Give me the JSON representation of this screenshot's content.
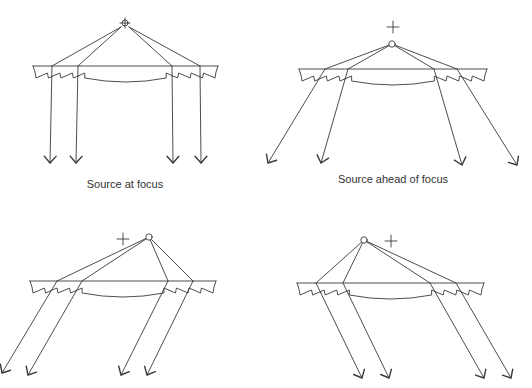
{
  "figure": {
    "colors": {
      "line": "#3a3a3a",
      "background": "#ffffff",
      "text": "#333333"
    }
  },
  "panels": [
    {
      "id": "at-focus",
      "caption": "Source at focus",
      "caption_pos": [
        125,
        178
      ],
      "lens": {
        "x0": 33,
        "x1": 218,
        "y": 66
      },
      "focus_marker": {
        "type": "crosshair-circle",
        "x": 125,
        "y": 23
      },
      "source": {
        "x": 125,
        "y": 23,
        "show_circle": false
      },
      "rays": [
        {
          "hit_x": 52,
          "tip": [
            50,
            163
          ]
        },
        {
          "hit_x": 78,
          "tip": [
            76,
            163
          ]
        },
        {
          "hit_x": 172,
          "tip": [
            173,
            163
          ]
        },
        {
          "hit_x": 200,
          "tip": [
            201,
            163
          ]
        }
      ]
    },
    {
      "id": "ahead-of-focus",
      "caption": "Source ahead of focus",
      "caption_pos": [
        393,
        173
      ],
      "lens": {
        "x0": 299,
        "x1": 487,
        "y": 69
      },
      "focus_marker": {
        "type": "plus",
        "x": 393,
        "y": 27
      },
      "source": {
        "x": 392,
        "y": 44,
        "show_circle": true
      },
      "rays": [
        {
          "hit_x": 325,
          "tip": [
            268,
            163
          ]
        },
        {
          "hit_x": 348,
          "tip": [
            321,
            163
          ]
        },
        {
          "hit_x": 434,
          "tip": [
            462,
            165
          ]
        },
        {
          "hit_x": 457,
          "tip": [
            517,
            165
          ]
        }
      ]
    },
    {
      "id": "off-axis-right",
      "caption": "",
      "lens": {
        "x0": 30,
        "x1": 216,
        "y": 281
      },
      "focus_marker": {
        "type": "plus",
        "x": 123,
        "y": 239
      },
      "source": {
        "x": 149,
        "y": 237,
        "show_circle": true
      },
      "rays": [
        {
          "hit_x": 57,
          "tip": [
            2,
            373
          ]
        },
        {
          "hit_x": 82,
          "tip": [
            28,
            375
          ]
        },
        {
          "hit_x": 168,
          "tip": [
            121,
            375
          ]
        },
        {
          "hit_x": 193,
          "tip": [
            147,
            375
          ]
        }
      ]
    },
    {
      "id": "off-axis-left",
      "caption": "",
      "lens": {
        "x0": 297,
        "x1": 484,
        "y": 283
      },
      "focus_marker": {
        "type": "plus",
        "x": 391,
        "y": 241
      },
      "source": {
        "x": 364,
        "y": 240,
        "show_circle": true
      },
      "rays": [
        {
          "hit_x": 316,
          "tip": [
            362,
            378
          ]
        },
        {
          "hit_x": 343,
          "tip": [
            389,
            378
          ]
        },
        {
          "hit_x": 430,
          "tip": [
            484,
            378
          ]
        },
        {
          "hit_x": 456,
          "tip": [
            511,
            378
          ]
        }
      ]
    }
  ]
}
